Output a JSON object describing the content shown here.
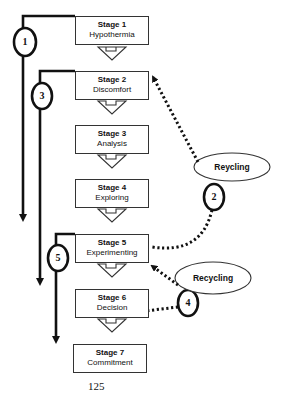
{
  "stages": [
    {
      "number": "Stage 1",
      "name": "Hypothermia"
    },
    {
      "number": "Stage 2",
      "name": "Discomfort"
    },
    {
      "number": "Stage 3",
      "name": "Analysis"
    },
    {
      "number": "Stage 4",
      "name": "Exploring"
    },
    {
      "number": "Stage 5",
      "name": "Experimenting"
    },
    {
      "number": "Stage 6",
      "name": "Decision"
    },
    {
      "number": "Stage 7",
      "name": "Commitment"
    }
  ],
  "recycling_labels": [
    "Reycling",
    "Recycling"
  ],
  "circles": [
    "1",
    "2",
    "3",
    "4",
    "5"
  ],
  "page_number": "125"
}
